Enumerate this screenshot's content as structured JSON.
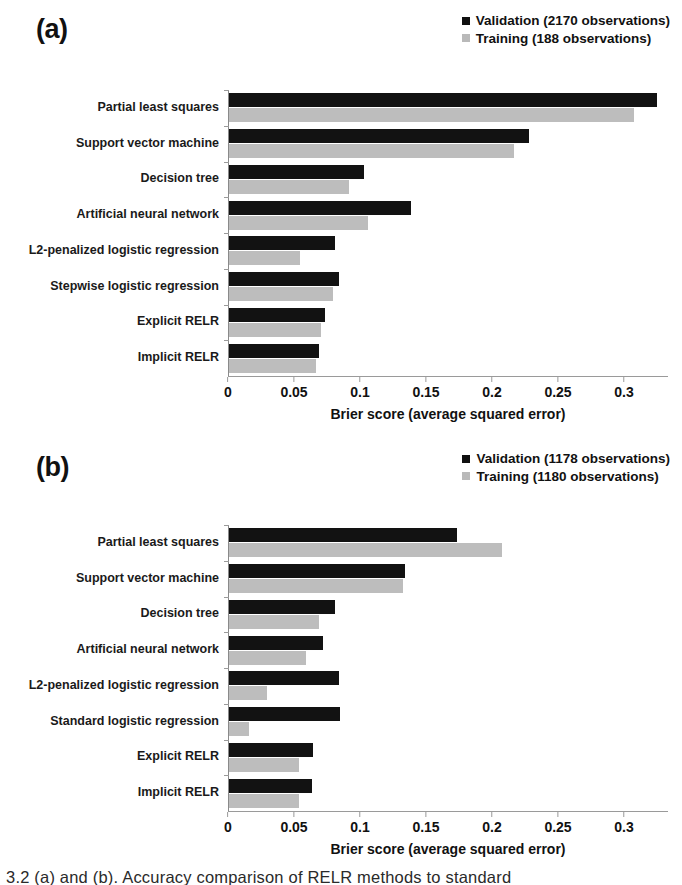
{
  "figure": {
    "caption_clipped": "3.2 (a) and (b). Accuracy comparison of RELR methods to standard",
    "axis_title": "Brier score (average squared error)",
    "colors": {
      "validation": "#121212",
      "training": "#bdbdbd",
      "axis": "#9a9a9a",
      "text": "#1a1a1a"
    },
    "legend_icons": {
      "validation": "filled-square-icon",
      "training": "filled-square-icon"
    }
  },
  "chart_data": [
    {
      "type": "bar",
      "orientation": "horizontal",
      "panel": "(a)",
      "title": "",
      "xlabel": "Brier score (average squared error)",
      "ylabel": "",
      "xlim": [
        0,
        0.3333
      ],
      "xticks": [
        0,
        0.05,
        0.1,
        0.15,
        0.2,
        0.25,
        0.3
      ],
      "xticklabels": [
        "0",
        "0.05",
        "0.1",
        "0.15",
        "0.2",
        "0.25",
        "0.3"
      ],
      "grid": false,
      "legend_position": "top-right",
      "categories": [
        "Partial least squares",
        "Support vector machine",
        "Decision tree",
        "Artificial neural network",
        "L2-penalized logistic regression",
        "Stepwise logistic regression",
        "Explicit RELR",
        "Implicit RELR"
      ],
      "series": [
        {
          "name": "Validation (2170 observations)",
          "color": "#121212",
          "values": [
            0.324,
            0.227,
            0.102,
            0.138,
            0.08,
            0.083,
            0.073,
            0.068
          ]
        },
        {
          "name": "Training (188 observations)",
          "color": "#bdbdbd",
          "values": [
            0.307,
            0.216,
            0.091,
            0.105,
            0.054,
            0.079,
            0.07,
            0.066
          ]
        }
      ]
    },
    {
      "type": "bar",
      "orientation": "horizontal",
      "panel": "(b)",
      "title": "",
      "xlabel": "Brier score (average squared error)",
      "ylabel": "",
      "xlim": [
        0,
        0.3333
      ],
      "xticks": [
        0,
        0.05,
        0.1,
        0.15,
        0.2,
        0.25,
        0.3
      ],
      "xticklabels": [
        "0",
        "0.05",
        "0.1",
        "0.15",
        "0.2",
        "0.25",
        "0.3"
      ],
      "grid": false,
      "legend_position": "top-right",
      "categories": [
        "Partial least squares",
        "Support vector machine",
        "Decision tree",
        "Artificial neural network",
        "L2-penalized logistic regression",
        "Standard logistic regression",
        "Explicit RELR",
        "Implicit RELR"
      ],
      "series": [
        {
          "name": "Validation (1178 observations)",
          "color": "#121212",
          "values": [
            0.173,
            0.133,
            0.08,
            0.071,
            0.083,
            0.084,
            0.064,
            0.063
          ]
        },
        {
          "name": "Training (1180 observations)",
          "color": "#bdbdbd",
          "values": [
            0.207,
            0.132,
            0.068,
            0.058,
            0.029,
            0.015,
            0.053,
            0.053
          ]
        }
      ]
    }
  ]
}
